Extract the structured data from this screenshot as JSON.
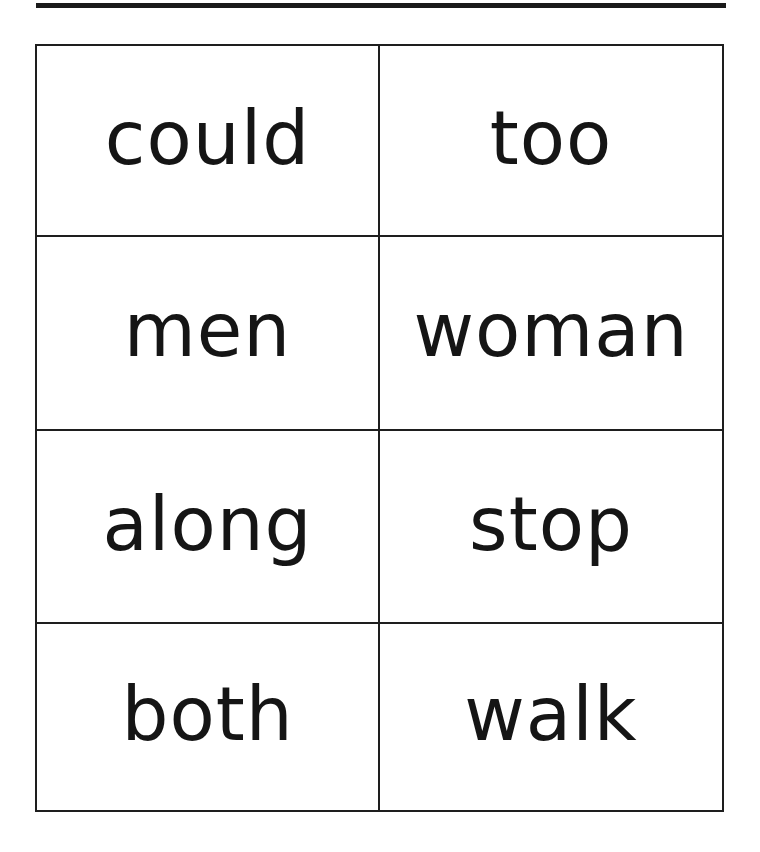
{
  "cards": [
    {
      "word": "could"
    },
    {
      "word": "too"
    },
    {
      "word": "men"
    },
    {
      "word": "woman"
    },
    {
      "word": "along"
    },
    {
      "word": "stop"
    },
    {
      "word": "both"
    },
    {
      "word": "walk"
    }
  ],
  "colors": {
    "ink": "#151515",
    "background": "#ffffff"
  }
}
